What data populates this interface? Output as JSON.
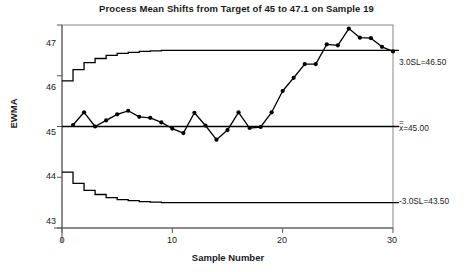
{
  "chart_data": {
    "type": "line",
    "title": "Process Mean Shifts from Target of 45 to 47.1 on Sample 19",
    "xlabel": "Sample Number",
    "ylabel": "EWMA",
    "xlim": [
      0,
      30
    ],
    "ylim": [
      43,
      47
    ],
    "xticks": [
      "0",
      "10",
      "20",
      "30"
    ],
    "xtick_values": [
      0,
      10,
      20,
      30
    ],
    "yticks": [
      "43",
      "44",
      "45",
      "46",
      "47"
    ],
    "ytick_values": [
      43,
      44,
      45,
      46,
      47
    ],
    "grid": false,
    "legend": "none",
    "markers": "filled-circle",
    "series": [
      {
        "name": "EWMA",
        "x": [
          1,
          2,
          3,
          4,
          5,
          6,
          7,
          8,
          9,
          10,
          11,
          12,
          13,
          14,
          15,
          16,
          17,
          18,
          19,
          20,
          21,
          22,
          23,
          24,
          25,
          26,
          27,
          28,
          29,
          30
        ],
        "values": [
          45.03,
          45.28,
          45.0,
          45.12,
          45.24,
          45.31,
          45.19,
          45.17,
          45.08,
          44.96,
          44.87,
          45.27,
          45.02,
          44.74,
          44.93,
          45.28,
          44.97,
          44.99,
          45.28,
          45.7,
          45.96,
          46.23,
          46.23,
          46.62,
          46.6,
          46.93,
          46.75,
          46.74,
          46.57,
          46.48
        ]
      }
    ],
    "center_line": {
      "label": "x=45.00",
      "double_bar": "=",
      "label_text": "x=45.00",
      "value": 45.0
    },
    "upper_limit": {
      "label": "3.0SL=46.50",
      "value": 46.5,
      "steps": [
        45.9,
        46.12,
        46.26,
        46.34,
        46.4,
        46.44,
        46.46,
        46.48,
        46.49,
        46.5
      ]
    },
    "lower_limit": {
      "label": "-3.0SL=43.50",
      "value": 43.5,
      "steps": [
        44.1,
        43.88,
        43.74,
        43.66,
        43.6,
        43.56,
        43.54,
        43.52,
        43.51,
        43.5
      ]
    },
    "annotations": [
      {
        "text": "3.0SL=46.50",
        "value": 46.5
      },
      {
        "text": "x=45.00",
        "value": 45.0
      },
      {
        "text": "-3.0SL=43.50",
        "value": 43.5
      }
    ],
    "colors": {
      "line": "#000000",
      "marker": "#000000",
      "limit": "#000000",
      "axis": "#555555",
      "frame": "#888888",
      "background": "#ffffff"
    }
  }
}
